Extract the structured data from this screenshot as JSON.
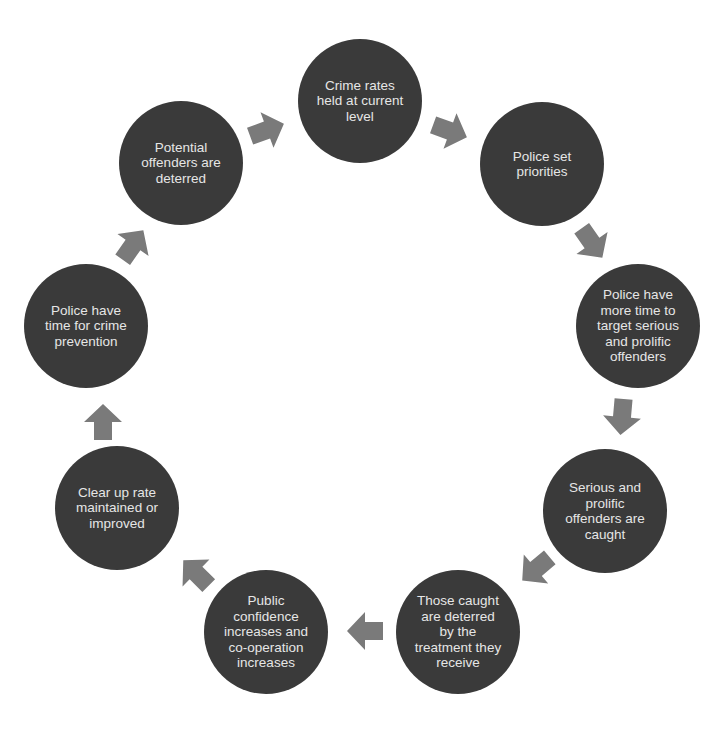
{
  "diagram": {
    "type": "cycle",
    "colors": {
      "node_fill": "#3a3a3a",
      "node_text": "#e6e6e6",
      "arrow_fill": "#7a7a7a",
      "background": "#ffffff"
    },
    "nodes": [
      {
        "id": "n1",
        "label": "Crime rates\nheld at current\nlevel",
        "cx": 360,
        "cy": 101
      },
      {
        "id": "n2",
        "label": "Police set\npriorities",
        "cx": 542,
        "cy": 164
      },
      {
        "id": "n3",
        "label": "Police have\nmore time to\ntarget serious\nand prolific\noffenders",
        "cx": 638,
        "cy": 326
      },
      {
        "id": "n4",
        "label": "Serious and\nprolific\noffenders are\ncaught",
        "cx": 605,
        "cy": 511
      },
      {
        "id": "n5",
        "label": "Those caught\nare deterred\nby the\ntreatment they\nreceive",
        "cx": 458,
        "cy": 632
      },
      {
        "id": "n6",
        "label": "Public\nconfidence\nincreases and\nco-operation\nincreases",
        "cx": 266,
        "cy": 632
      },
      {
        "id": "n7",
        "label": "Clear up rate\nmaintained or\nimproved",
        "cx": 117,
        "cy": 508
      },
      {
        "id": "n8",
        "label": "Police have\ntime for crime\nprevention",
        "cx": 86,
        "cy": 326
      },
      {
        "id": "n9",
        "label": "Potential\noffenders are\ndeterred",
        "cx": 181,
        "cy": 163
      }
    ],
    "arrows": [
      {
        "from": "n9",
        "to": "n1",
        "cx": 267,
        "cy": 130,
        "angle": -20
      },
      {
        "from": "n1",
        "to": "n2",
        "cx": 450,
        "cy": 131,
        "angle": 20
      },
      {
        "from": "n2",
        "to": "n3",
        "cx": 592,
        "cy": 243,
        "angle": 55
      },
      {
        "from": "n3",
        "to": "n4",
        "cx": 622,
        "cy": 417,
        "angle": 95
      },
      {
        "from": "n4",
        "to": "n5",
        "cx": 536,
        "cy": 569,
        "angle": 140
      },
      {
        "from": "n5",
        "to": "n6",
        "cx": 365,
        "cy": 631,
        "angle": 180
      },
      {
        "from": "n6",
        "to": "n7",
        "cx": 196,
        "cy": 573,
        "angle": -135
      },
      {
        "from": "n7",
        "to": "n8",
        "cx": 103,
        "cy": 422,
        "angle": -90
      },
      {
        "from": "n8",
        "to": "n9",
        "cx": 133,
        "cy": 245,
        "angle": -55
      }
    ]
  }
}
